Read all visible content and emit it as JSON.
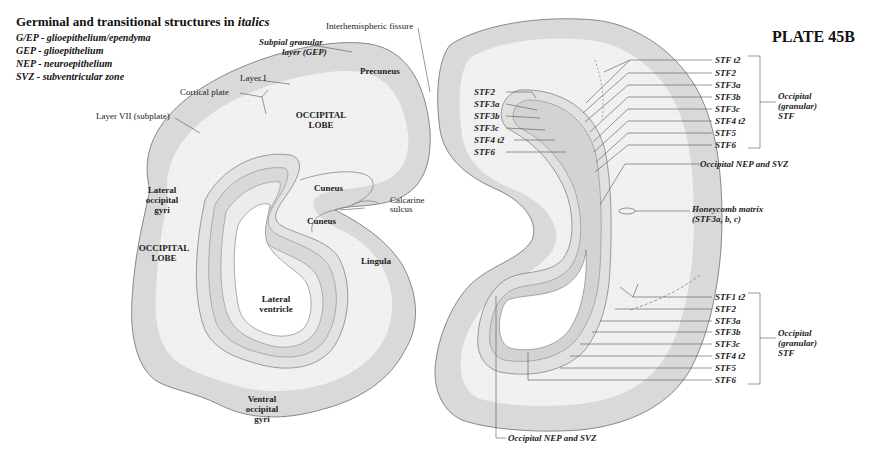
{
  "legend": {
    "title_prefix": "Germinal and transitional structures in ",
    "title_emph": "italics",
    "items": [
      "G/EP - glioepithelium/ependyma",
      "GEP - glioepithelium",
      "NEP - neuroepithelium",
      "SVZ - subventricular zone"
    ]
  },
  "plate": "PLATE 45B",
  "left_section": {
    "labels": {
      "interhemispheric": "Interhemispheric fissure",
      "subpial_1": "Subpial granular",
      "subpial_2": "layer (GEP)",
      "precuneus": "Precuneus",
      "layer1": "Layer I",
      "cortical_plate": "Cortical plate",
      "layer7": "Layer VII (subplate)",
      "occ_lobe_top_1": "OCCIPITAL",
      "occ_lobe_top_2": "LOBE",
      "lat_occ_1": "Lateral",
      "lat_occ_2": "occipital",
      "lat_occ_3": "gyri",
      "occ_lobe_left_1": "OCCIPITAL",
      "occ_lobe_left_2": "LOBE",
      "cuneus_1": "Cuneus",
      "cuneus_2": "Cuneus",
      "calcarine_1": "Calcarine",
      "calcarine_2": "sulcus",
      "lingula": "Lingula",
      "lat_vent_1": "Lateral",
      "lat_vent_2": "ventricle",
      "ventral_1": "Ventral",
      "ventral_2": "occipital",
      "ventral_3": "gyri"
    }
  },
  "right_section": {
    "left_labels": [
      "STF2",
      "STF3a",
      "STF3b",
      "STF3c",
      "STF4 t2",
      "STF6"
    ],
    "upper_right_labels": [
      "STF t2",
      "STF2",
      "STF3a",
      "STF3b",
      "STF3c",
      "STF4 t2",
      "STF5",
      "STF6"
    ],
    "upper_group_1": "Occipital",
    "upper_group_2": "(granular)",
    "upper_group_3": "STF",
    "nep_svz_upper": "Occipital NEP and SVZ",
    "honeycomb_1": "Honeycomb matrix",
    "honeycomb_2": "(STF3a, b, c)",
    "lower_right_labels": [
      "STF1 t2",
      "STF2",
      "STF3a",
      "STF3b",
      "STF3c",
      "STF4 t2",
      "STF5",
      "STF6"
    ],
    "lower_group_1": "Occipital",
    "lower_group_2": "(granular)",
    "lower_group_3": "STF",
    "nep_svz_lower": "Occipital NEP and SVZ"
  },
  "colors": {
    "cortex_band": "#d6d6d6",
    "white_matter": "#efefef",
    "outline": "#777777",
    "leader": "#555555",
    "background": "#ffffff"
  }
}
